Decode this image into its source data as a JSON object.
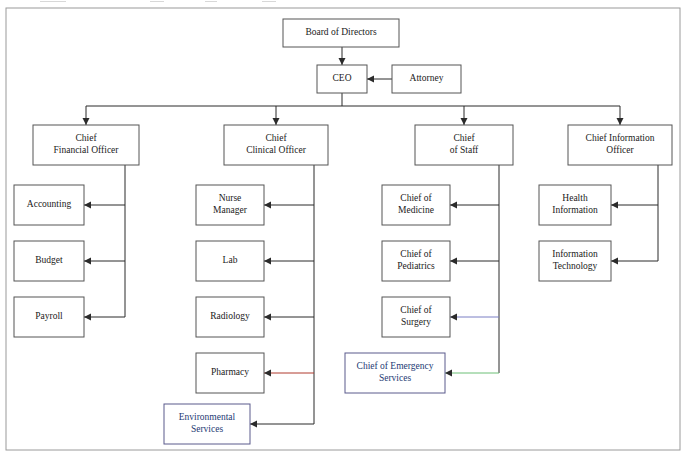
{
  "document": {
    "title": "Hospital Organizational Chart",
    "frame": {
      "x": 6,
      "y": 8,
      "width": 674,
      "height": 442
    }
  },
  "colors": {
    "box_stroke": "#555555",
    "accent_box_stroke": "#5a5a8c",
    "accent_text": "#243a73",
    "text": "#1a1a1a",
    "frame_stroke": "#9a9a9a",
    "link_default": "#2b2b2b",
    "link_red": "#b03a2e",
    "link_blue": "#7b7fc4",
    "link_green": "#6cbf77"
  },
  "nodes": [
    {
      "id": "board",
      "label_lines": [
        "Board of Directors"
      ],
      "x": 283,
      "y": 19,
      "w": 116,
      "h": 28,
      "accent": false
    },
    {
      "id": "ceo",
      "label_lines": [
        "CEO"
      ],
      "x": 317,
      "y": 65,
      "w": 50,
      "h": 28,
      "accent": false
    },
    {
      "id": "attorney",
      "label_lines": [
        "Attorney"
      ],
      "x": 392,
      "y": 65,
      "w": 69,
      "h": 28,
      "accent": false
    },
    {
      "id": "cfo",
      "label_lines": [
        "Chief",
        "Financial Officer"
      ],
      "x": 33,
      "y": 125,
      "w": 106,
      "h": 40,
      "accent": false
    },
    {
      "id": "cco",
      "label_lines": [
        "Chief",
        "Clinical Officer"
      ],
      "x": 224,
      "y": 125,
      "w": 104,
      "h": 40,
      "accent": false
    },
    {
      "id": "cos",
      "label_lines": [
        "Chief",
        "of Staff"
      ],
      "x": 415,
      "y": 125,
      "w": 98,
      "h": 40,
      "accent": false
    },
    {
      "id": "cio",
      "label_lines": [
        "Chief Information",
        "Officer"
      ],
      "x": 568,
      "y": 125,
      "w": 104,
      "h": 40,
      "accent": false
    },
    {
      "id": "accounting",
      "label_lines": [
        "Accounting"
      ],
      "x": 14,
      "y": 185,
      "w": 70,
      "h": 40,
      "accent": false
    },
    {
      "id": "budget",
      "label_lines": [
        "Budget"
      ],
      "x": 14,
      "y": 241,
      "w": 70,
      "h": 40,
      "accent": false
    },
    {
      "id": "payroll",
      "label_lines": [
        "Payroll"
      ],
      "x": 14,
      "y": 297,
      "w": 70,
      "h": 40,
      "accent": false
    },
    {
      "id": "nurse",
      "label_lines": [
        "Nurse",
        "Manager"
      ],
      "x": 196,
      "y": 185,
      "w": 68,
      "h": 40,
      "accent": false
    },
    {
      "id": "lab",
      "label_lines": [
        "Lab"
      ],
      "x": 196,
      "y": 241,
      "w": 68,
      "h": 40,
      "accent": false
    },
    {
      "id": "radiology",
      "label_lines": [
        "Radiology"
      ],
      "x": 196,
      "y": 297,
      "w": 68,
      "h": 40,
      "accent": false
    },
    {
      "id": "pharmacy",
      "label_lines": [
        "Pharmacy"
      ],
      "x": 196,
      "y": 353,
      "w": 68,
      "h": 40,
      "accent": false
    },
    {
      "id": "envservices",
      "label_lines": [
        "Environmental",
        "Services"
      ],
      "x": 164,
      "y": 404,
      "w": 86,
      "h": 40,
      "accent": true
    },
    {
      "id": "medicine",
      "label_lines": [
        "Chief of",
        "Medicine"
      ],
      "x": 382,
      "y": 185,
      "w": 68,
      "h": 40,
      "accent": false
    },
    {
      "id": "pediatrics",
      "label_lines": [
        "Chief of",
        "Pediatrics"
      ],
      "x": 382,
      "y": 241,
      "w": 68,
      "h": 40,
      "accent": false
    },
    {
      "id": "surgery",
      "label_lines": [
        "Chief of",
        "Surgery"
      ],
      "x": 382,
      "y": 297,
      "w": 68,
      "h": 40,
      "accent": false
    },
    {
      "id": "emergency",
      "label_lines": [
        "Chief of Emergency",
        "Services"
      ],
      "x": 345,
      "y": 353,
      "w": 100,
      "h": 40,
      "accent": true
    },
    {
      "id": "healthinfo",
      "label_lines": [
        "Health",
        "Information"
      ],
      "x": 539,
      "y": 185,
      "w": 72,
      "h": 40,
      "accent": false
    },
    {
      "id": "infotech",
      "label_lines": [
        "Information",
        "Technology"
      ],
      "x": 539,
      "y": 241,
      "w": 72,
      "h": 40,
      "accent": false
    }
  ],
  "edges": [
    {
      "id": "board-to-ceo",
      "from": "board",
      "to": "ceo",
      "color": "default"
    },
    {
      "id": "attorney-to-ceo",
      "from": "attorney",
      "to": "ceo",
      "color": "default"
    },
    {
      "id": "ceo-to-cfo",
      "from": "ceo",
      "to": "cfo",
      "color": "default"
    },
    {
      "id": "ceo-to-cco",
      "from": "ceo",
      "to": "cco",
      "color": "default"
    },
    {
      "id": "ceo-to-cos",
      "from": "ceo",
      "to": "cos",
      "color": "default"
    },
    {
      "id": "ceo-to-cio",
      "from": "ceo",
      "to": "cio",
      "color": "default"
    },
    {
      "id": "cfo-to-accounting",
      "from": "cfo",
      "to": "accounting",
      "color": "default"
    },
    {
      "id": "cfo-to-budget",
      "from": "cfo",
      "to": "budget",
      "color": "default"
    },
    {
      "id": "cfo-to-payroll",
      "from": "cfo",
      "to": "payroll",
      "color": "default"
    },
    {
      "id": "cco-to-nurse",
      "from": "cco",
      "to": "nurse",
      "color": "default"
    },
    {
      "id": "cco-to-lab",
      "from": "cco",
      "to": "lab",
      "color": "default"
    },
    {
      "id": "cco-to-radiology",
      "from": "cco",
      "to": "radiology",
      "color": "default"
    },
    {
      "id": "cco-to-pharmacy",
      "from": "cco",
      "to": "pharmacy",
      "color": "red"
    },
    {
      "id": "cco-to-envservices",
      "from": "cco",
      "to": "envservices",
      "color": "default"
    },
    {
      "id": "cos-to-medicine",
      "from": "cos",
      "to": "medicine",
      "color": "default"
    },
    {
      "id": "cos-to-pediatrics",
      "from": "cos",
      "to": "pediatrics",
      "color": "default"
    },
    {
      "id": "cos-to-surgery",
      "from": "cos",
      "to": "surgery",
      "color": "blue"
    },
    {
      "id": "cos-to-emergency",
      "from": "cos",
      "to": "emergency",
      "color": "green"
    },
    {
      "id": "cio-to-healthinfo",
      "from": "cio",
      "to": "healthinfo",
      "color": "default"
    },
    {
      "id": "cio-to-infotech",
      "from": "cio",
      "to": "infotech",
      "color": "default"
    }
  ],
  "trunk": {
    "bar_y": 106,
    "left_x": 86,
    "right_x": 620,
    "ceo_stem_x": 342,
    "branch_x": [
      86,
      276,
      464,
      620
    ]
  }
}
